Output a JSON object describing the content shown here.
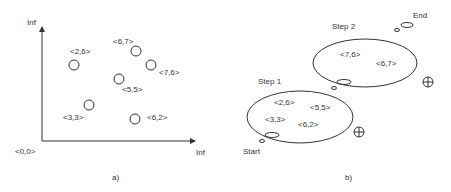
{
  "panel_a": {
    "caption": "a)",
    "origin_label": "<0,0>",
    "y_axis_label": "Inf",
    "x_axis_label": "Inf",
    "points": [
      {
        "label": "<2,6>"
      },
      {
        "label": "<6,7>"
      },
      {
        "label": "<7,6>"
      },
      {
        "label": "<5,5>"
      },
      {
        "label": "<3,3>"
      },
      {
        "label": "<6,2>"
      }
    ]
  },
  "panel_b": {
    "caption": "b)",
    "start_label": "Start",
    "end_label": "End",
    "step1": {
      "label": "Step 1",
      "items": [
        "<2,6>",
        "<5,5>",
        "<3,3>",
        "<6,2>"
      ]
    },
    "step2": {
      "label": "Step 2",
      "items": [
        "<7,6>",
        "<6,7>"
      ]
    },
    "symbol": "crossed-circle"
  },
  "colors": {
    "stroke": "#333333",
    "background": "#ffffff"
  }
}
